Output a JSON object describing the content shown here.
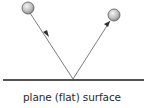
{
  "diagram": {
    "caption": "plane (flat) surface",
    "elements": {
      "incident_ball": {
        "cx": 28,
        "cy": 8,
        "r": 6,
        "icon": "sphere"
      },
      "reflected_ball": {
        "cx": 114,
        "cy": 15,
        "r": 6,
        "icon": "sphere"
      },
      "reflection_point": {
        "x": 73,
        "y": 79
      },
      "surface": {
        "x1": 3,
        "x2": 144,
        "y": 80
      }
    },
    "arrows": [
      {
        "name": "incident-ray",
        "direction": "toward surface"
      },
      {
        "name": "reflected-ray",
        "direction": "away from surface"
      }
    ],
    "colors": {
      "ray": "#6e6e6e",
      "surface": "#1a1a1a",
      "ball_light": "#f4f4f4",
      "ball_dark": "#8c8c8c",
      "ball_outline": "#5a5a5a",
      "text": "#2b2b2b"
    }
  }
}
